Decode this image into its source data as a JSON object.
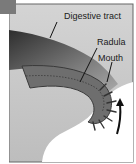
{
  "diagram": {
    "labels": {
      "digestive_tract": "Digestive tract",
      "radula": "Radula",
      "mouth": "Mouth"
    },
    "colors": {
      "background": "#ffffff",
      "tissue_light": "#c8c8c8",
      "tissue_mid": "#9a9a9a",
      "tissue_dark": "#3a3a3a",
      "border": "#555555"
    },
    "icons": [
      "arrow-up-curved-icon",
      "radula-teeth-icon"
    ]
  }
}
